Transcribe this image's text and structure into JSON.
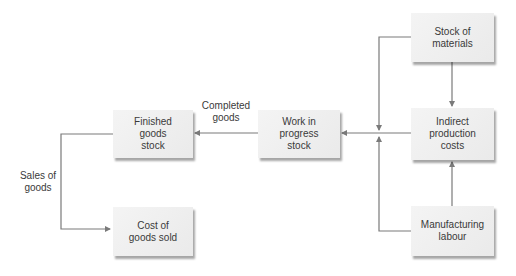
{
  "diagram": {
    "nodes": {
      "finished_goods": {
        "label": "Finished\ngoods\nstock"
      },
      "work_in_progress": {
        "label": "Work in\nprogress\nstock"
      },
      "stock_materials": {
        "label": "Stock of\nmaterials"
      },
      "indirect_costs": {
        "label": "Indirect\nproduction\ncosts"
      },
      "manufacturing_labour": {
        "label": "Manufacturing\nlabour"
      },
      "cost_goods_sold": {
        "label": "Cost of\ngoods sold"
      }
    },
    "edge_labels": {
      "completed_goods": "Completed\ngoods",
      "sales_of_goods": "Sales of\ngoods"
    },
    "edges": [
      {
        "from": "work_in_progress",
        "to": "finished_goods",
        "label": "Completed goods"
      },
      {
        "from": "finished_goods",
        "to": "cost_goods_sold",
        "label": "Sales of goods"
      },
      {
        "from": "stock_materials",
        "to": "indirect_costs"
      },
      {
        "from": "manufacturing_labour",
        "to": "indirect_costs"
      },
      {
        "from": "stock_materials",
        "to": "work_in_progress"
      },
      {
        "from": "manufacturing_labour",
        "to": "work_in_progress"
      },
      {
        "from": "indirect_costs",
        "to": "work_in_progress"
      }
    ],
    "colors": {
      "line": "#7a7a7a",
      "box": "#ececec",
      "text": "#3a3a3a"
    }
  }
}
